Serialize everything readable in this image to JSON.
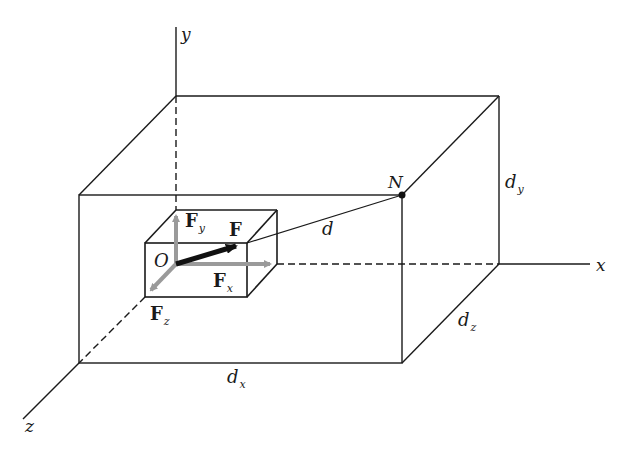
{
  "diagram": {
    "colors": {
      "background": "#ffffff",
      "line": "#1a1a1a",
      "component_arrow": "#9a9a9a",
      "resultant_arrow": "#111111"
    },
    "axes": {
      "x": {
        "label": "x"
      },
      "y": {
        "label": "y"
      },
      "z": {
        "label": "z"
      }
    },
    "points": {
      "origin": {
        "label": "O"
      },
      "target": {
        "label": "N"
      }
    },
    "vectors": {
      "resultant": {
        "label": "F"
      },
      "fx": {
        "label": "F",
        "sub": "x"
      },
      "fy": {
        "label": "F",
        "sub": "y"
      },
      "fz": {
        "label": "F",
        "sub": "z"
      }
    },
    "distances": {
      "d": {
        "label": "d"
      },
      "dx": {
        "label": "d",
        "sub": "x"
      },
      "dy": {
        "label": "d",
        "sub": "y"
      },
      "dz": {
        "label": "d",
        "sub": "z"
      }
    }
  }
}
